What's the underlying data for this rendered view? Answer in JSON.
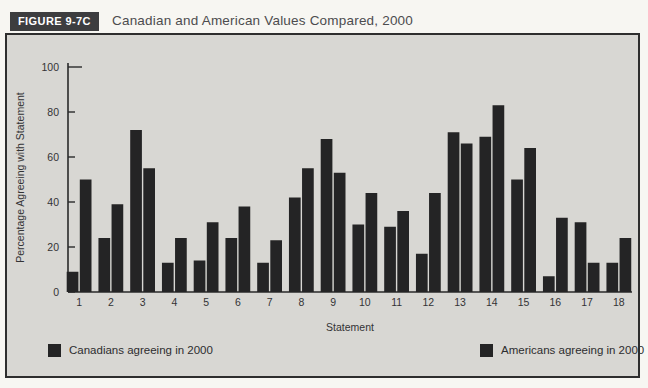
{
  "figure": {
    "tag": "FIGURE 9-7C",
    "title": "Canadian and American Values Compared, 2000"
  },
  "chart_data": {
    "type": "bar",
    "title": "Canadian and American Values Compared, 2000",
    "xlabel": "Statement",
    "ylabel": "Percentage Agreeing with Statement",
    "ylim": [
      0,
      100
    ],
    "yticks": [
      0,
      20,
      40,
      60,
      80,
      100
    ],
    "grid": false,
    "legend_position": "bottom",
    "categories": [
      "1",
      "2",
      "3",
      "4",
      "5",
      "6",
      "7",
      "8",
      "9",
      "10",
      "11",
      "12",
      "13",
      "14",
      "15",
      "16",
      "17",
      "18"
    ],
    "series": [
      {
        "name": "Canadians agreeing in 2000",
        "color": "#242425",
        "values": [
          9,
          24,
          72,
          13,
          14,
          24,
          13,
          42,
          68,
          30,
          29,
          17,
          71,
          69,
          50,
          7,
          31,
          13
        ]
      },
      {
        "name": "Americans agreeing in 2000",
        "color": "#242425",
        "values": [
          50,
          39,
          55,
          24,
          31,
          38,
          23,
          55,
          53,
          44,
          36,
          44,
          66,
          83,
          64,
          33,
          13,
          24
        ]
      }
    ]
  },
  "colors": {
    "page_bg": "#f7f6f2",
    "panel_bg": "#d8d7d3",
    "panel_border": "#2e2e2e",
    "bar": "#242425",
    "axis": "#2a2a2a",
    "text": "#333335",
    "header_bg": "#3d3d3f",
    "header_text": "#ffffff"
  }
}
